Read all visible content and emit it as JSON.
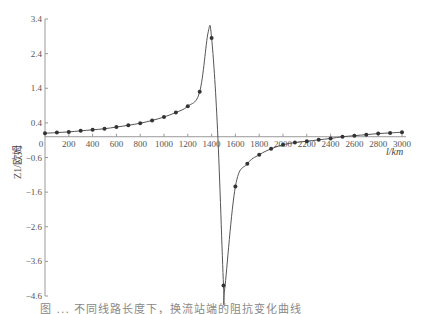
{
  "chart_data": {
    "type": "line",
    "title": "",
    "xlabel": "l/km",
    "ylabel": "Z1/欧姆",
    "xlim": [
      0,
      3000
    ],
    "ylim": [
      -4.6,
      3.4
    ],
    "x_ticks": [
      0,
      200,
      400,
      600,
      800,
      1000,
      1200,
      1400,
      1600,
      1800,
      2000,
      2200,
      2400,
      2600,
      2800,
      3000
    ],
    "y_ticks": [
      3.4,
      2.4,
      1.4,
      0.4,
      -0.6,
      -1.6,
      -2.6,
      -3.6,
      -4.6
    ],
    "grid": false,
    "legend": null,
    "series": [
      {
        "name": "Z1",
        "marker": "circle",
        "x": [
          0,
          100,
          200,
          300,
          400,
          500,
          600,
          700,
          800,
          900,
          1000,
          1100,
          1200,
          1300,
          1400,
          1500,
          1600,
          1700,
          1800,
          1900,
          2000,
          2100,
          2200,
          2300,
          2400,
          2500,
          2600,
          2700,
          2800,
          2900,
          3000
        ],
        "values": [
          0.1,
          0.12,
          0.14,
          0.17,
          0.2,
          0.23,
          0.28,
          0.33,
          0.39,
          0.47,
          0.57,
          0.7,
          0.88,
          1.3,
          2.85,
          -4.3,
          -1.44,
          -0.78,
          -0.52,
          -0.35,
          -0.23,
          -0.17,
          -0.13,
          -0.09,
          -0.05,
          0.0,
          0.03,
          0.06,
          0.09,
          0.11,
          0.13
        ]
      }
    ],
    "curve_extrema": {
      "peak": {
        "x": 1370,
        "y": 3.0
      },
      "trough": {
        "x": 1510,
        "y": -4.4
      }
    }
  },
  "axes": {
    "x_axis_label": "l/km",
    "y_axis_label": "Z1/欧姆"
  },
  "caption": "图 ...  不同线路长度下，换流站端的阻抗变化曲线"
}
